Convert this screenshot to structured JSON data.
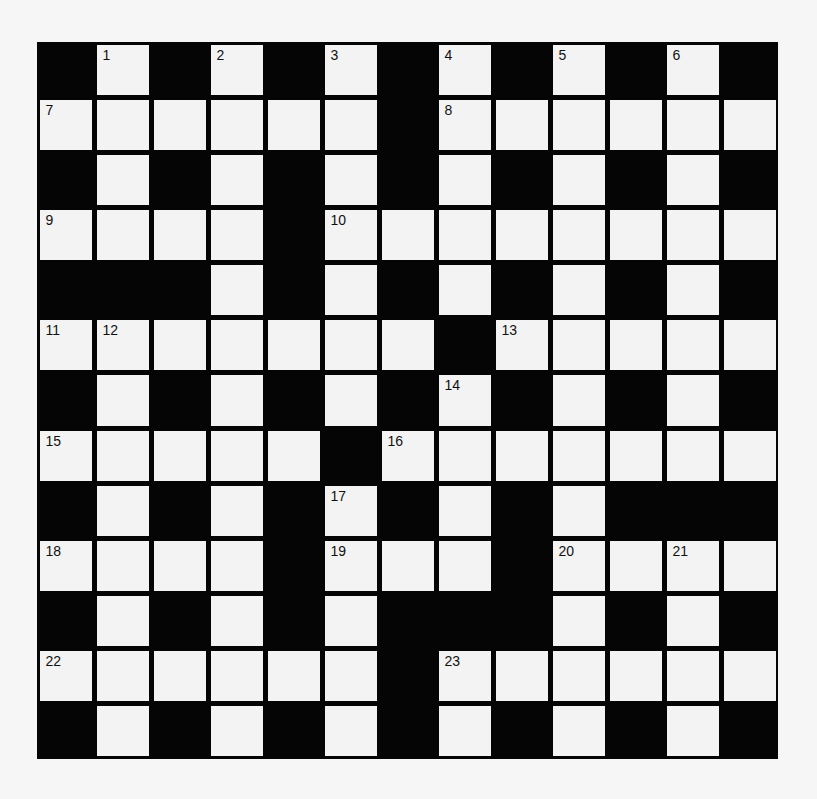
{
  "puzzle": {
    "type": "crossword",
    "rows": 13,
    "cols": 13,
    "colors": {
      "block": "#050505",
      "cell": "#f3f3f3",
      "page": "#f6f6f6",
      "number": "#111111"
    },
    "grid": [
      "#.#.#.#.#.#.#",
      "......#......",
      "#.#.#.#.#.#.#",
      "....#........",
      "###.#.#.#.#.#",
      ".......#.....",
      "#.#.#.#.#.#.#",
      ".....#.......",
      "#.#.#.#.#.###",
      "....#...#....",
      "#.#.#.###.#.#",
      "......#......",
      "#.#.#.#.#.#.#"
    ],
    "numbers": [
      {
        "n": "1",
        "r": 0,
        "c": 1
      },
      {
        "n": "2",
        "r": 0,
        "c": 3
      },
      {
        "n": "3",
        "r": 0,
        "c": 5
      },
      {
        "n": "4",
        "r": 0,
        "c": 7
      },
      {
        "n": "5",
        "r": 0,
        "c": 9
      },
      {
        "n": "6",
        "r": 0,
        "c": 11
      },
      {
        "n": "7",
        "r": 1,
        "c": 0
      },
      {
        "n": "8",
        "r": 1,
        "c": 7
      },
      {
        "n": "9",
        "r": 3,
        "c": 0
      },
      {
        "n": "10",
        "r": 3,
        "c": 5
      },
      {
        "n": "11",
        "r": 5,
        "c": 0
      },
      {
        "n": "12",
        "r": 5,
        "c": 1
      },
      {
        "n": "13",
        "r": 5,
        "c": 8
      },
      {
        "n": "14",
        "r": 6,
        "c": 7
      },
      {
        "n": "15",
        "r": 7,
        "c": 0
      },
      {
        "n": "16",
        "r": 7,
        "c": 6
      },
      {
        "n": "17",
        "r": 8,
        "c": 5
      },
      {
        "n": "18",
        "r": 9,
        "c": 0
      },
      {
        "n": "19",
        "r": 9,
        "c": 5
      },
      {
        "n": "20",
        "r": 9,
        "c": 9
      },
      {
        "n": "21",
        "r": 9,
        "c": 11
      },
      {
        "n": "22",
        "r": 11,
        "c": 0
      },
      {
        "n": "23",
        "r": 11,
        "c": 7
      }
    ],
    "entries": []
  }
}
